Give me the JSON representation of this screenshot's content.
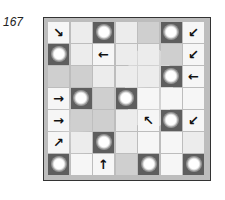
{
  "puzzle": {
    "number": "167",
    "rows": 7,
    "cols": 7,
    "cells": [
      [
        {
          "t": "arrow",
          "v": "↘",
          "icon": "arrow-down-right-icon"
        },
        {
          "t": "light"
        },
        {
          "t": "sun"
        },
        {
          "t": "light"
        },
        {
          "t": "gray"
        },
        {
          "t": "sun"
        },
        {
          "t": "arrow",
          "v": "↙",
          "icon": "arrow-down-left-icon"
        }
      ],
      [
        {
          "t": "sun"
        },
        {
          "t": "light"
        },
        {
          "t": "arrow",
          "v": "←",
          "icon": "arrow-left-icon"
        },
        {
          "t": "light"
        },
        {
          "t": "light"
        },
        {
          "t": "gray"
        },
        {
          "t": "arrow",
          "v": "↙",
          "icon": "arrow-down-left-icon"
        }
      ],
      [
        {
          "t": "gray"
        },
        {
          "t": "gray"
        },
        {
          "t": "light"
        },
        {
          "t": "light"
        },
        {
          "t": "light"
        },
        {
          "t": "sun"
        },
        {
          "t": "arrow",
          "v": "←",
          "icon": "arrow-left-icon"
        }
      ],
      [
        {
          "t": "arrow",
          "v": "→",
          "icon": "arrow-right-icon"
        },
        {
          "t": "sun"
        },
        {
          "t": "gray"
        },
        {
          "t": "sun"
        },
        {
          "t": "white"
        },
        {
          "t": "white"
        },
        {
          "t": "white"
        }
      ],
      [
        {
          "t": "arrow",
          "v": "→",
          "icon": "arrow-right-icon"
        },
        {
          "t": "gray"
        },
        {
          "t": "gray"
        },
        {
          "t": "light"
        },
        {
          "t": "arrow",
          "v": "↖",
          "icon": "arrow-up-left-icon"
        },
        {
          "t": "sun"
        },
        {
          "t": "arrow",
          "v": "↙",
          "icon": "arrow-down-left-icon"
        }
      ],
      [
        {
          "t": "arrow",
          "v": "↗",
          "icon": "arrow-up-right-icon"
        },
        {
          "t": "light"
        },
        {
          "t": "sun"
        },
        {
          "t": "light"
        },
        {
          "t": "white"
        },
        {
          "t": "white"
        },
        {
          "t": "light"
        }
      ],
      [
        {
          "t": "sun"
        },
        {
          "t": "white"
        },
        {
          "t": "arrow",
          "v": "↑",
          "icon": "arrow-up-icon"
        },
        {
          "t": "gray"
        },
        {
          "t": "sun"
        },
        {
          "t": "white"
        },
        {
          "t": "sun"
        }
      ]
    ]
  },
  "colors": {
    "sun_cell": "#5e5e5e",
    "board_bg": "#bdbdbd",
    "arrow": "#111111"
  }
}
